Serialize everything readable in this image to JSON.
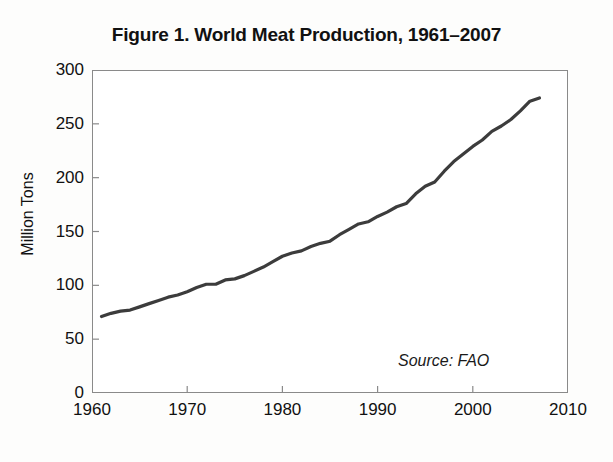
{
  "figure": {
    "title": "Figure 1. World Meat Production, 1961–2007",
    "source_note": "Source: FAO",
    "line_color": "#3c3c3c",
    "axis_color": "#8a8a8a",
    "background": "#ffffff"
  },
  "chart_data": {
    "type": "line",
    "title": "Figure 1. World Meat Production, 1961–2007",
    "xlabel": "",
    "ylabel": "Million Tons",
    "xlim": [
      1960,
      2010
    ],
    "ylim": [
      0,
      300
    ],
    "xticks": [
      1960,
      1970,
      1980,
      1990,
      2000,
      2010
    ],
    "yticks": [
      0,
      50,
      100,
      150,
      200,
      250,
      300
    ],
    "grid": false,
    "legend": null,
    "annotations": [
      "Source: FAO"
    ],
    "series": [
      {
        "name": "World Meat Production",
        "units": "Million Tons",
        "x": [
          1961,
          1962,
          1963,
          1964,
          1965,
          1966,
          1967,
          1968,
          1969,
          1970,
          1971,
          1972,
          1973,
          1974,
          1975,
          1976,
          1977,
          1978,
          1979,
          1980,
          1981,
          1982,
          1983,
          1984,
          1985,
          1986,
          1987,
          1988,
          1989,
          1990,
          1991,
          1992,
          1993,
          1994,
          1995,
          1996,
          1997,
          1998,
          1999,
          2000,
          2001,
          2002,
          2003,
          2004,
          2005,
          2006,
          2007
        ],
        "y": [
          71,
          74,
          76,
          77,
          80,
          83,
          86,
          89,
          91,
          94,
          98,
          101,
          101,
          105,
          106,
          109,
          113,
          117,
          122,
          127,
          130,
          132,
          136,
          139,
          141,
          147,
          152,
          157,
          159,
          164,
          168,
          173,
          176,
          185,
          192,
          196,
          206,
          215,
          222,
          229,
          235,
          243,
          248,
          254,
          262,
          271,
          274
        ]
      }
    ]
  },
  "axes": {
    "y_labels": [
      "300",
      "250",
      "200",
      "150",
      "100",
      "50",
      "0"
    ],
    "y_title": "Million Tons",
    "x_labels": [
      "1960",
      "1970",
      "1980",
      "1990",
      "2000",
      "2010"
    ]
  }
}
